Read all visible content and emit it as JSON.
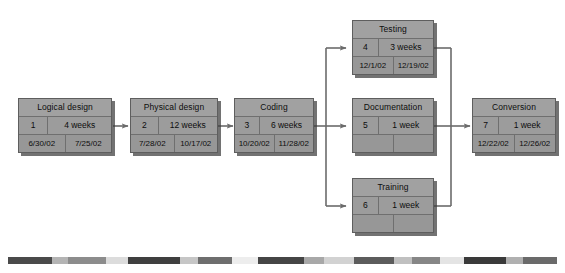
{
  "diagram": {
    "type": "project-network-diagram",
    "node_legend": {
      "row1": "task name",
      "row2_left": "task id",
      "row2_right": "duration",
      "row3_left": "start date",
      "row3_right": "finish date"
    },
    "nodes": [
      {
        "key": "logical-design",
        "title": "Logical design",
        "id": "1",
        "duration": "4 weeks",
        "start": "6/30/02",
        "finish": "7/25/02"
      },
      {
        "key": "physical-design",
        "title": "Physical design",
        "id": "2",
        "duration": "12 weeks",
        "start": "7/28/02",
        "finish": "10/17/02"
      },
      {
        "key": "coding",
        "title": "Coding",
        "id": "3",
        "duration": "6 weeks",
        "start": "10/20/02",
        "finish": "11/28/02"
      },
      {
        "key": "testing",
        "title": "Testing",
        "id": "4",
        "duration": "3 weeks",
        "start": "12/1/02",
        "finish": "12/19/02"
      },
      {
        "key": "documentation",
        "title": "Documentation",
        "id": "5",
        "duration": "1 week",
        "start": "",
        "finish": ""
      },
      {
        "key": "training",
        "title": "Training",
        "id": "6",
        "duration": "1 week",
        "start": "",
        "finish": ""
      },
      {
        "key": "conversion",
        "title": "Conversion",
        "id": "7",
        "duration": "1 week",
        "start": "12/22/02",
        "finish": "12/26/02"
      }
    ],
    "links": [
      {
        "from": "logical-design",
        "to": "physical-design"
      },
      {
        "from": "physical-design",
        "to": "coding"
      },
      {
        "from": "coding",
        "to": "testing"
      },
      {
        "from": "coding",
        "to": "documentation"
      },
      {
        "from": "coding",
        "to": "training"
      },
      {
        "from": "testing",
        "to": "conversion"
      },
      {
        "from": "documentation",
        "to": "conversion"
      },
      {
        "from": "training",
        "to": "conversion"
      }
    ],
    "colors": {
      "node_fill": "#9c9c9c",
      "node_border": "#5e5e5e",
      "node_shadow": "#3c3c3c",
      "connector": "#6b6b6b",
      "background": "#ffffff"
    },
    "footer_rule": {
      "segments": [
        {
          "color": "#4a4a4a",
          "width": 44
        },
        {
          "color": "#b4b4b4",
          "width": 16
        },
        {
          "color": "#8c8c8c",
          "width": 38
        },
        {
          "color": "#dcdcdc",
          "width": 22
        },
        {
          "color": "#3f3f3f",
          "width": 52
        },
        {
          "color": "#c6c6c6",
          "width": 18
        },
        {
          "color": "#6e6e6e",
          "width": 34
        },
        {
          "color": "#ededed",
          "width": 26
        },
        {
          "color": "#454545",
          "width": 46
        },
        {
          "color": "#a8a8a8",
          "width": 20
        },
        {
          "color": "#d2d2d2",
          "width": 30
        },
        {
          "color": "#5c5c5c",
          "width": 40
        },
        {
          "color": "#c0c0c0",
          "width": 18
        },
        {
          "color": "#868686",
          "width": 28
        },
        {
          "color": "#e4e4e4",
          "width": 24
        },
        {
          "color": "#3a3a3a",
          "width": 42
        },
        {
          "color": "#b0b0b0",
          "width": 17
        },
        {
          "color": "#6a6a6a",
          "width": 34
        }
      ]
    }
  }
}
